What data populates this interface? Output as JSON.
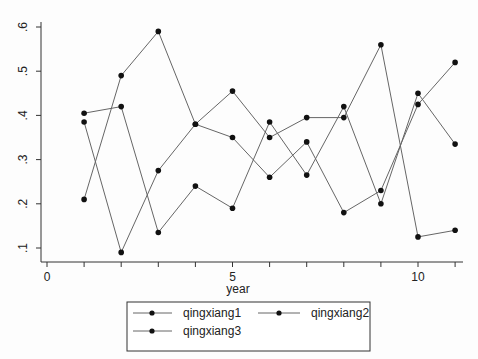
{
  "chart_data": {
    "type": "line",
    "title": "",
    "xlabel": "year",
    "ylabel": "",
    "x": [
      1,
      2,
      3,
      4,
      5,
      6,
      7,
      8,
      9,
      10,
      11
    ],
    "xlim": [
      -0.2,
      11.4
    ],
    "ylim": [
      0.067,
      0.61
    ],
    "xticks": [
      0,
      5,
      10
    ],
    "xticks_minor": [
      1,
      2,
      3,
      4,
      6,
      7,
      8,
      9,
      11
    ],
    "yticks": [
      0.1,
      0.2,
      0.3,
      0.4,
      0.5,
      0.6
    ],
    "ytick_labels": [
      ".1",
      ".2",
      ".3",
      ".4",
      ".5",
      ".6"
    ],
    "grid": false,
    "legend_position": "bottom",
    "series": [
      {
        "name": "qingxiang1",
        "values": [
          0.405,
          0.42,
          0.135,
          0.24,
          0.19,
          0.385,
          0.265,
          0.42,
          0.2,
          0.45,
          0.335
        ]
      },
      {
        "name": "qingxiang2",
        "values": [
          0.385,
          0.09,
          0.275,
          0.38,
          0.455,
          0.35,
          0.395,
          0.395,
          0.56,
          0.125,
          0.14
        ]
      },
      {
        "name": "qingxiang3",
        "values": [
          0.21,
          0.49,
          0.59,
          0.38,
          0.35,
          0.26,
          0.34,
          0.18,
          0.23,
          0.425,
          0.52
        ]
      }
    ]
  },
  "legend": {
    "items": [
      "qingxiang1",
      "qingxiang2",
      "qingxiang3"
    ]
  },
  "axes": {
    "xlabel": "year"
  }
}
